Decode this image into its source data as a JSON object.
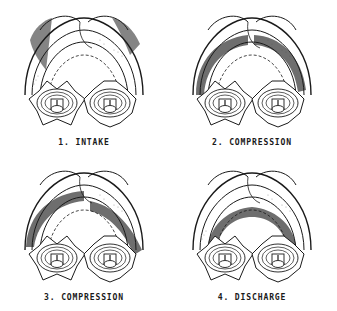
{
  "figure": {
    "colors": {
      "shade": "#6e6e6e",
      "line": "#1a1a1a",
      "background": "#ffffff"
    },
    "stages": [
      {
        "label": "1. INTAKE"
      },
      {
        "label": "2. COMPRESSION"
      },
      {
        "label": "3. COMPRESSION"
      },
      {
        "label": "4. DISCHARGE"
      }
    ]
  }
}
